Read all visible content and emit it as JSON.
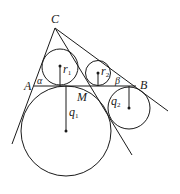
{
  "diagram": {
    "type": "geometry",
    "points": {
      "C": {
        "label": "C"
      },
      "A": {
        "label": "A"
      },
      "B": {
        "label": "B"
      },
      "M": {
        "label": "M"
      }
    },
    "angles": {
      "alpha": {
        "label": "α"
      },
      "beta": {
        "label": "β"
      }
    },
    "radii": {
      "r1": {
        "label": "r",
        "sub": "1"
      },
      "r2": {
        "label": "r",
        "sub": "2"
      },
      "q1": {
        "label": "q",
        "sub": "1"
      },
      "q2": {
        "label": "q",
        "sub": "2"
      }
    },
    "colors": {
      "stroke": "#1a1a1a",
      "background": "#ffffff"
    }
  }
}
